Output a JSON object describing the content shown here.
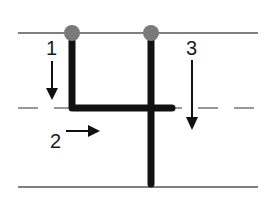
{
  "diagram": {
    "colors": {
      "background": "#ffffff",
      "guide_line": "#555555",
      "stroke": "#111111",
      "start_dot": "#7a7a7a",
      "arrow": "#111111"
    },
    "guide_lines": {
      "top_y": 33,
      "mid_y": 108,
      "bottom_y": 187,
      "x_start": 18,
      "x_end": 258,
      "mid_style": "dashed"
    },
    "strokes": [
      {
        "number": "1",
        "direction": "down",
        "label_x": 46,
        "label_y": 38
      },
      {
        "number": "2",
        "direction": "right",
        "label_x": 50,
        "label_y": 131
      },
      {
        "number": "3",
        "direction": "down",
        "label_x": 186,
        "label_y": 38
      }
    ]
  }
}
